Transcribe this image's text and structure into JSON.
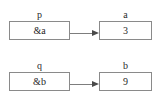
{
  "diagram": {
    "type": "pointer-diagram",
    "background_color": "#ffffff",
    "box_border_color": "#8a8a8a",
    "arrow_color": "#7d7d7d",
    "rows": [
      {
        "pointer": {
          "label": "p",
          "value": "&a"
        },
        "target": {
          "label": "a",
          "value": "3"
        },
        "arrow": {
          "from": "p",
          "to": "a",
          "direction": "right"
        }
      },
      {
        "pointer": {
          "label": "q",
          "value": "&b"
        },
        "target": {
          "label": "b",
          "value": "9"
        },
        "arrow": {
          "from": "q",
          "to": "b",
          "direction": "right"
        }
      }
    ]
  }
}
